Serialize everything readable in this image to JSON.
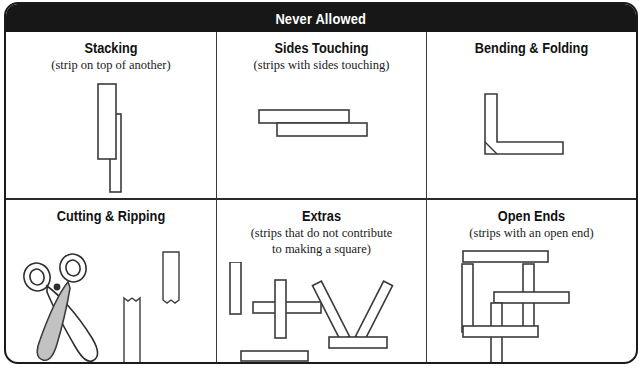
{
  "header": {
    "title": "Never Allowed"
  },
  "panels": [
    {
      "key": "stacking",
      "title": "Stacking",
      "subtitle": "(strip on top of another)",
      "subtitle2": "",
      "figure": "two-overlapping-vertical-strips"
    },
    {
      "key": "sides-touching",
      "title": "Sides Touching",
      "subtitle": "(strips with sides touching)",
      "subtitle2": "",
      "figure": "two-horizontal-strips-touching"
    },
    {
      "key": "bending-folding",
      "title": "Bending & Folding",
      "subtitle": "",
      "subtitle2": "",
      "figure": "l-shaped-bent-strip"
    },
    {
      "key": "cutting-ripping",
      "title": "Cutting & Ripping",
      "subtitle": "",
      "subtitle2": "",
      "figure": "scissors-and-torn-strips"
    },
    {
      "key": "extras",
      "title": "Extras",
      "subtitle": "(strips that do not contribute",
      "subtitle2": "to making a square)",
      "figure": "loose-strips-cross-and-triangle"
    },
    {
      "key": "open-ends",
      "title": "Open Ends",
      "subtitle": "(strips with an open end)",
      "subtitle2": "",
      "figure": "strips-with-protruding-open-ends"
    }
  ],
  "colors": {
    "header_background": "#171717",
    "header_text": "#ffffff",
    "border": "#1a1a1a",
    "strip_outline": "#3b3b3b",
    "strip_fill": "#ffffff",
    "page_background": "#ffffff"
  }
}
